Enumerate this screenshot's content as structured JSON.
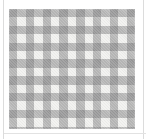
{
  "image": {
    "kind": "fabric-swatch",
    "caption": "Gingham check fabric swatch",
    "alt_text": "Grey and white gingham checked fabric"
  },
  "pattern": {
    "name": "gingham",
    "weave": "plain-weave-diagonal-texture",
    "columns": 15,
    "rows": 14,
    "cell_size_px": 8.4,
    "tones": {
      "light": "#f2f2f0",
      "medium": "#b0b0ae",
      "dark": "#78787a"
    }
  },
  "frame": {
    "background": "#ffffff",
    "rule_color": "#dcdcdc",
    "swatch_left_px": 9,
    "swatch_top_px": 9,
    "swatch_width_px": 126,
    "swatch_height_px": 120
  }
}
